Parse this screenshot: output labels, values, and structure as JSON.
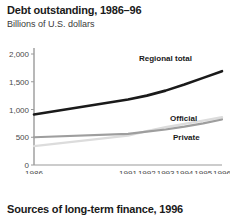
{
  "figure": {
    "title": "Debt outstanding, 1986–96",
    "subtitle": "Billions of U.S. dollars",
    "footer_title": "Sources of long-term finance, 1996"
  },
  "colors": {
    "regional_total": "#1a1a1a",
    "official": "#dcdcdc",
    "private": "#9e9e9e",
    "axis": "#9a9a9a",
    "text": "#231f20"
  },
  "chart_data": {
    "type": "line",
    "title": "Debt outstanding, 1986–96",
    "subtitle": "Billions of U.S. dollars",
    "xlabel": "",
    "ylabel": "Billions of U.S. dollars",
    "ylim": [
      0,
      2000
    ],
    "yticks": [
      0,
      500,
      1000,
      1500,
      2000
    ],
    "ytick_labels": [
      "0",
      "500",
      "1,000",
      "1,500",
      "2,000"
    ],
    "categories": [
      "1986",
      "1991",
      "1992",
      "1993",
      "1994",
      "1995",
      "1996"
    ],
    "x": [
      1986,
      1991,
      1992,
      1993,
      1994,
      1995,
      1996
    ],
    "grid": false,
    "legend": "inline-labels",
    "series": [
      {
        "name": "Regional total",
        "color": "#1a1a1a",
        "values": [
          910,
          1180,
          1250,
          1340,
          1450,
          1570,
          1690
        ]
      },
      {
        "name": "Official",
        "color": "#dcdcdc",
        "values": [
          340,
          530,
          610,
          680,
          740,
          800,
          860
        ]
      },
      {
        "name": "Private",
        "color": "#9e9e9e",
        "values": [
          500,
          560,
          600,
          640,
          690,
          750,
          820
        ]
      }
    ]
  }
}
